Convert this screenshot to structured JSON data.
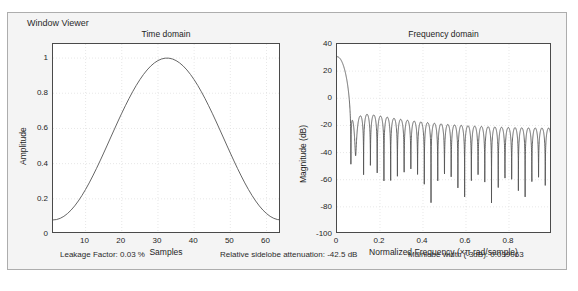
{
  "window": {
    "title": "Window Viewer"
  },
  "status": {
    "items": [
      {
        "name": "leakage-factor",
        "text": "Leakage Factor: 0.03 %"
      },
      {
        "name": "relative-sidelobe-attenuation",
        "text": "Relative sidelobe attenuation: -42.5 dB"
      },
      {
        "name": "mainlobe-width",
        "text": "Mainlobe width (-3dB): 0.039063"
      }
    ]
  },
  "colors": {
    "panel_background": "#f4f4f4",
    "panel_border": "#adadad",
    "plot_background": "#ffffff",
    "axis": "#4a4a4a",
    "grid": "#d8d8d8",
    "curve": "#555555",
    "text": "#1e1e1e"
  },
  "chart_data": [
    {
      "type": "line",
      "name": "time-domain",
      "title": "Time domain",
      "xlabel": "Samples",
      "ylabel": "Amplitude",
      "xlim": [
        1,
        64
      ],
      "ylim": [
        0,
        1.08
      ],
      "xticks": [
        10,
        20,
        30,
        40,
        50,
        60
      ],
      "yticks": [
        0,
        0.2,
        0.4,
        0.6,
        0.8,
        1
      ],
      "grid": true,
      "legend": "none",
      "window_type": "hamming",
      "length": 64,
      "annotation": "Hamming window w[n] = 0.54 - 0.46*cos(2*pi*n/(N-1)), N = 64",
      "x": [
        1,
        4,
        7,
        10,
        13,
        16,
        19,
        22,
        25,
        28,
        31,
        33,
        35,
        38,
        41,
        44,
        47,
        50,
        53,
        56,
        59,
        62,
        64
      ],
      "values": [
        0.08,
        0.1,
        0.16,
        0.25,
        0.37,
        0.5,
        0.63,
        0.76,
        0.87,
        0.95,
        0.99,
        1.0,
        0.99,
        0.95,
        0.88,
        0.77,
        0.64,
        0.51,
        0.38,
        0.26,
        0.16,
        0.1,
        0.08
      ]
    },
    {
      "type": "line",
      "name": "frequency-domain",
      "title": "Frequency domain",
      "xlabel": "Normalized Frequency  (×π rad/sample)",
      "ylabel": "Magnitude (dB)",
      "xlim": [
        0,
        1
      ],
      "ylim": [
        -100,
        40
      ],
      "xticks": [
        0,
        0.2,
        0.4,
        0.6,
        0.8
      ],
      "yticks": [
        40,
        20,
        0,
        -20,
        -40,
        -60,
        -80,
        -100
      ],
      "grid": true,
      "legend": "none",
      "annotation": "DTFT magnitude of a 64-point Hamming window; mainlobe peak ~32 dB, first sidelobe ~-11 dB, sidelobes decaying to ~-75 dB near Nyquist",
      "mainlobe_peak_db": 32,
      "first_sidelobe_db": -11,
      "sidelobe_count": 31,
      "x": [
        0,
        0.02,
        0.04,
        0.0625,
        0.08,
        0.1,
        0.2,
        0.3,
        0.4,
        0.5,
        0.6,
        0.7,
        0.8,
        0.9,
        1.0
      ],
      "values": [
        32,
        29,
        18,
        -40,
        -14,
        -16,
        -17,
        -18,
        -19,
        -20,
        -21,
        -22,
        -22,
        -23,
        -23
      ],
      "sidelobe_envelope_peaks_db": [
        -14,
        -15,
        -15,
        -16,
        -16,
        -17,
        -17,
        -17,
        -18,
        -18,
        -19,
        -19,
        -20,
        -20,
        -20,
        -21,
        -21,
        -21,
        -22,
        -22,
        -22,
        -23,
        -23,
        -23,
        -23
      ],
      "sidelobe_envelope_nulls_db": [
        -40,
        -41,
        -43,
        -45,
        -47,
        -48,
        -49,
        -50,
        -52,
        -53,
        -55,
        -56,
        -58,
        -59,
        -61,
        -62,
        -64,
        -66,
        -68,
        -70,
        -72,
        -75,
        -78,
        -82
      ]
    }
  ]
}
